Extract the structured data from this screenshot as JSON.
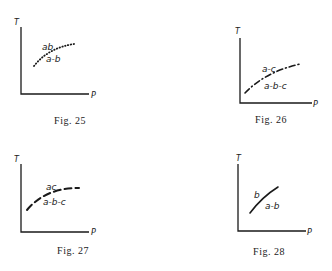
{
  "figures": [
    {
      "caption": "Fig. 25",
      "y_axis_label": "T",
      "x_axis_label": "P",
      "curve_style": "dotted",
      "label_above": "ab",
      "label_below": "a-b"
    },
    {
      "caption": "Fig. 26",
      "y_axis_label": "T",
      "x_axis_label": "P",
      "curve_style": "dash-dot",
      "label_above": "a-c",
      "label_below": "a-b-c"
    },
    {
      "caption": "Fig. 27",
      "y_axis_label": "T",
      "x_axis_label": "P",
      "curve_style": "dashed",
      "label_above": "ac",
      "label_below": "a-b-c"
    },
    {
      "caption": "Fig. 28",
      "y_axis_label": "T",
      "x_axis_label": "P",
      "curve_style": "solid",
      "label_above": "b",
      "label_below": "a-b"
    }
  ]
}
